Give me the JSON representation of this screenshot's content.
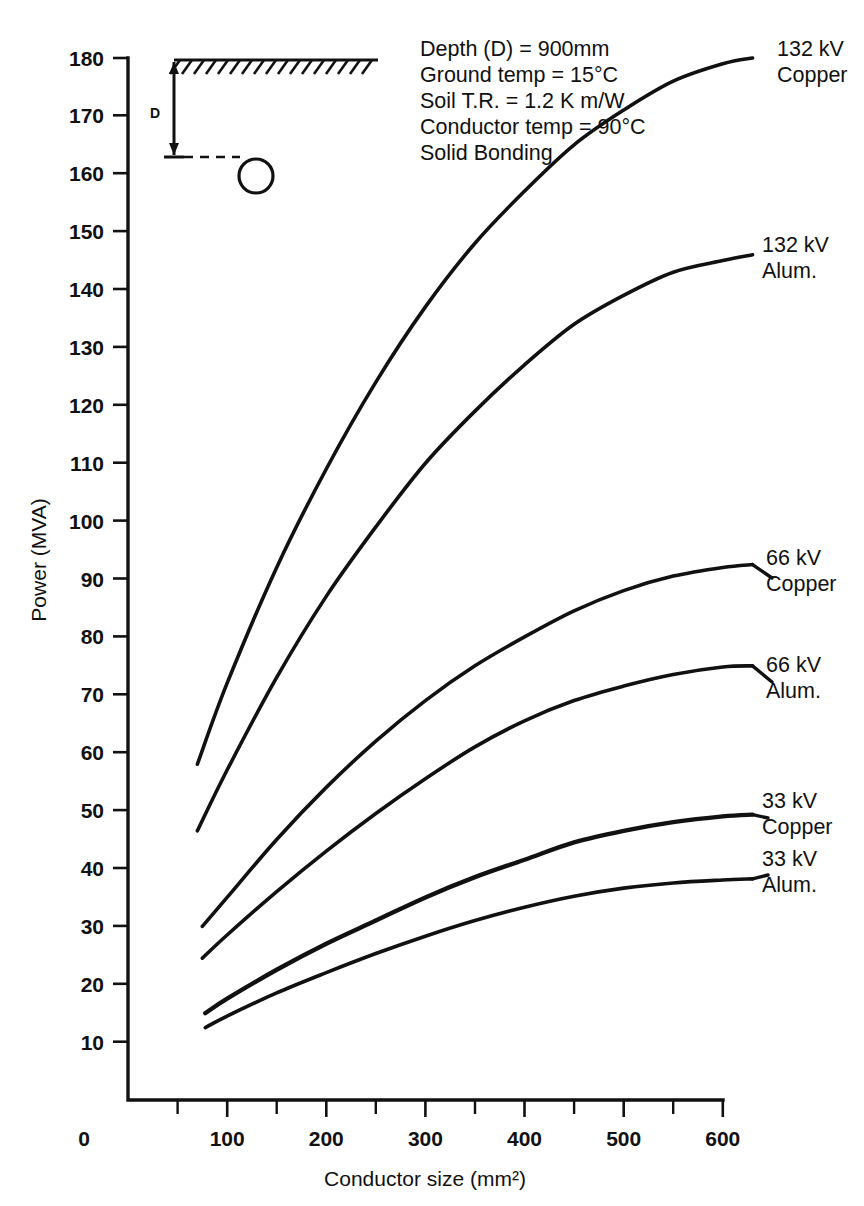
{
  "chart_data": {
    "type": "line",
    "title": "",
    "xlabel": "Conductor size (mm²)",
    "ylabel": "Power (MVA)",
    "xlim": [
      0,
      600
    ],
    "ylim": [
      0,
      180
    ],
    "grid": false,
    "legend_position": "right-inline-labels",
    "x_ticks": [
      0,
      100,
      200,
      300,
      400,
      500,
      600
    ],
    "x_tick_labels": [
      "0",
      "100",
      "200",
      "300",
      "400",
      "500",
      "600"
    ],
    "x_minor_ticks": [
      50,
      150,
      250,
      350,
      450,
      550
    ],
    "y_ticks": [
      10,
      20,
      30,
      40,
      50,
      60,
      70,
      80,
      90,
      100,
      110,
      120,
      130,
      140,
      150,
      160,
      170,
      180
    ],
    "y_tick_labels": [
      "10",
      "20",
      "30",
      "40",
      "50",
      "60",
      "70",
      "80",
      "90",
      "100",
      "110",
      "120",
      "130",
      "140",
      "150",
      "160",
      "170",
      "180"
    ],
    "series": [
      {
        "name": "132 kV Copper",
        "label_line1": "132 kV",
        "label_line2": "Copper",
        "x": [
          70,
          100,
          150,
          200,
          250,
          300,
          350,
          400,
          450,
          500,
          550,
          600,
          630
        ],
        "y": [
          58,
          72,
          92,
          109,
          124,
          137,
          148,
          157,
          165,
          171,
          176,
          179,
          180
        ]
      },
      {
        "name": "132 kV Alum.",
        "label_line1": "132 kV",
        "label_line2": "Alum.",
        "x": [
          70,
          100,
          150,
          200,
          250,
          300,
          350,
          400,
          450,
          500,
          550,
          600,
          630
        ],
        "y": [
          46.5,
          57,
          73,
          87,
          99,
          110,
          119,
          127,
          134,
          139,
          143,
          145,
          146
        ]
      },
      {
        "name": "66 kV Copper",
        "label_line1": "66 kV",
        "label_line2": "Copper",
        "x": [
          75,
          100,
          150,
          200,
          250,
          300,
          350,
          400,
          450,
          500,
          550,
          600,
          630
        ],
        "y": [
          30,
          35,
          45,
          54,
          62,
          69,
          75,
          80,
          84.5,
          88,
          90.5,
          92,
          92.5
        ]
      },
      {
        "name": "66 kV Alum.",
        "label_line1": "66 kV",
        "label_line2": "Alum.",
        "x": [
          75,
          100,
          150,
          200,
          250,
          300,
          350,
          400,
          450,
          500,
          550,
          600,
          630
        ],
        "y": [
          24.5,
          28.5,
          36,
          43,
          49.5,
          55.5,
          61,
          65.5,
          69,
          71.5,
          73.5,
          74.8,
          75
        ]
      },
      {
        "name": "33 kV Copper",
        "label_line1": "33 kV",
        "label_line2": "Copper",
        "x": [
          78,
          100,
          150,
          200,
          250,
          300,
          350,
          400,
          450,
          500,
          550,
          600,
          630
        ],
        "y": [
          15,
          17.5,
          22.5,
          27,
          31,
          35,
          38.5,
          41.5,
          44.5,
          46.5,
          48,
          49,
          49.3
        ]
      },
      {
        "name": "33 kV Alum.",
        "label_line1": "33 kV",
        "label_line2": "Alum.",
        "x": [
          78,
          100,
          150,
          200,
          250,
          300,
          350,
          400,
          450,
          500,
          550,
          600,
          630
        ],
        "y": [
          12.5,
          14.5,
          18.5,
          22,
          25.3,
          28.3,
          31,
          33.3,
          35.2,
          36.6,
          37.5,
          38,
          38.2
        ]
      }
    ],
    "annotations": [
      "Depth (D)  =  900mm",
      "Ground temp  =  15°C",
      "Soil T.R.  =  1.2 K  m/W",
      "Conductor temp  =  90°C",
      "Solid Bonding"
    ],
    "inset": {
      "depth_label": "D",
      "description": "buried cable depth diagram"
    }
  }
}
